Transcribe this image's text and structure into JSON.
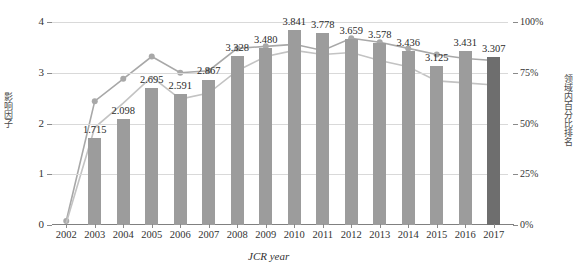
{
  "chart_data": {
    "type": "bar",
    "title": "",
    "xlabel": "JCR year",
    "ylabel": "影响因子",
    "y2label": "领域内百分比排名",
    "categories": [
      "2002",
      "2003",
      "2004",
      "2005",
      "2006",
      "2007",
      "2008",
      "2009",
      "2010",
      "2011",
      "2012",
      "2013",
      "2014",
      "2015",
      "2016",
      "2017"
    ],
    "ylim": [
      0,
      4
    ],
    "yticks": [
      "0",
      "1",
      "2",
      "3",
      "4"
    ],
    "y2lim": [
      0,
      100
    ],
    "y2ticks": [
      "0%",
      "25%",
      "50%",
      "75%",
      "100%"
    ],
    "grid": true,
    "legend": "none",
    "series": [
      {
        "name": "影响因子",
        "type": "bar",
        "axis": "left",
        "color": "#9c9c9c",
        "highlight_color": "#6e6e6e",
        "highlight_index": 15,
        "values": [
          0.0,
          1.715,
          2.098,
          2.695,
          2.591,
          2.867,
          3.328,
          3.48,
          3.841,
          3.778,
          3.659,
          3.578,
          3.436,
          3.125,
          3.431,
          3.307
        ],
        "labels": [
          "",
          "1.715",
          "2.098",
          "2.695",
          "2.591",
          "2.867",
          "3.328",
          "3.480",
          "3.841",
          "3.778",
          "3.659",
          "3.578",
          "3.436",
          "3.125",
          "3.431",
          "3.307"
        ]
      },
      {
        "name": "领域内百分比排名 A",
        "type": "line",
        "axis": "right",
        "color": "#a8a8a8",
        "marker": "circle",
        "values": [
          2,
          61,
          72,
          83,
          75,
          76,
          87,
          88,
          89,
          86,
          92,
          90,
          87,
          84,
          82,
          81
        ]
      },
      {
        "name": "领域内百分比排名 B",
        "type": "line",
        "axis": "right",
        "color": "#c3c3c3",
        "marker": "none",
        "values": [
          1,
          48,
          60,
          73,
          62,
          65,
          76,
          83,
          86,
          84,
          85,
          81,
          78,
          71,
          70,
          69
        ]
      }
    ]
  },
  "axes": {
    "left_title": "影响因子",
    "right_title": "领域内百分比排名",
    "x_title_italic": "JCR",
    "x_title_rest": " year"
  }
}
